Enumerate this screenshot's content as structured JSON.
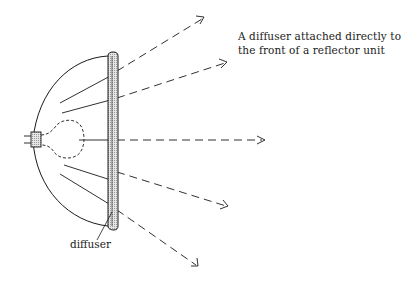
{
  "caption": {
    "line1": "A diffuser attached directly to",
    "line2": "the front of a reflector unit"
  },
  "labels": {
    "diffuser": "diffuser"
  },
  "components": [
    "reflector",
    "lamp-bulb",
    "lamp-base",
    "diffuser-plate",
    "light-rays"
  ],
  "rays": [
    {
      "name": "ray-upper",
      "direction": "up-right"
    },
    {
      "name": "ray-upper-mid",
      "direction": "right-slightly-up"
    },
    {
      "name": "ray-center",
      "direction": "right"
    },
    {
      "name": "ray-lower-mid",
      "direction": "right-slightly-down"
    },
    {
      "name": "ray-lower",
      "direction": "down-right"
    }
  ],
  "colors": {
    "line": "#1a1a1a",
    "diffuser_fill": "#cfcfcf",
    "background": "#ffffff"
  }
}
